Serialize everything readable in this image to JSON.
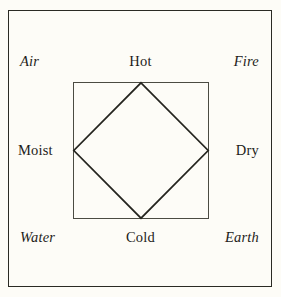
{
  "diagram": {
    "background_color": "#fdfcf7",
    "line_color": "#24241e",
    "frame_color": "#2a2a24",
    "square_color": "#4b4b42",
    "elements": [
      {
        "key": "air",
        "label": "Air",
        "position": "top-left"
      },
      {
        "key": "fire",
        "label": "Fire",
        "position": "top-right"
      },
      {
        "key": "water",
        "label": "Water",
        "position": "bottom-left"
      },
      {
        "key": "earth",
        "label": "Earth",
        "position": "bottom-right"
      }
    ],
    "qualities": [
      {
        "key": "hot",
        "label": "Hot",
        "position": "top-center"
      },
      {
        "key": "moist",
        "label": "Moist",
        "position": "middle-left"
      },
      {
        "key": "dry",
        "label": "Dry",
        "position": "middle-right"
      },
      {
        "key": "cold",
        "label": "Cold",
        "position": "bottom-center"
      }
    ],
    "shapes": {
      "outer_frame": "rectangle",
      "inner_square": "square",
      "inner_diamond": "diamond-inscribed-in-square"
    }
  }
}
